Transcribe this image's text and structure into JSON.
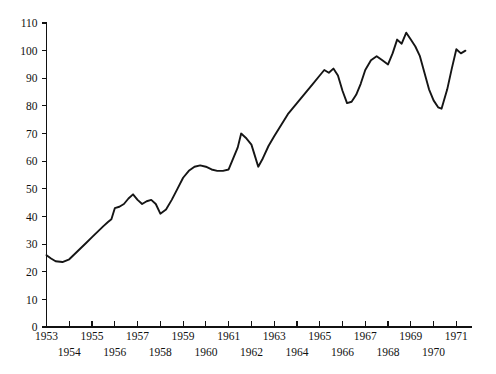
{
  "chart_data": {
    "type": "line",
    "title": "",
    "subtitle": "",
    "xlabel": "",
    "ylabel": "",
    "xlim": [
      1953.0,
      1971.6
    ],
    "ylim": [
      0,
      110
    ],
    "grid": false,
    "legend": null,
    "y_ticks": [
      0,
      10,
      20,
      30,
      40,
      50,
      60,
      70,
      80,
      90,
      100,
      110
    ],
    "y_tick_labels": [
      "0",
      "10",
      "20",
      "30",
      "40",
      "50",
      "60",
      "70",
      "80",
      "90",
      "100",
      "110"
    ],
    "x_ticks": [
      1953,
      1954,
      1955,
      1956,
      1957,
      1958,
      1959,
      1960,
      1961,
      1962,
      1963,
      1964,
      1965,
      1966,
      1967,
      1968,
      1969,
      1970,
      1971
    ],
    "x_tick_labels": [
      "1953",
      "1954",
      "1955",
      "1956",
      "1957",
      "1958",
      "1959",
      "1960",
      "1961",
      "1962",
      "1963",
      "1964",
      "1965",
      "1966",
      "1967",
      "1968",
      "1969",
      "1970",
      "1971"
    ],
    "x_tick_label_rows": [
      0,
      1,
      0,
      1,
      0,
      1,
      0,
      1,
      0,
      1,
      0,
      1,
      0,
      1,
      0,
      1,
      0,
      1,
      0
    ],
    "line_color": "#151515",
    "background_color": "#ffffff",
    "series": [
      {
        "name": "index",
        "x": [
          1953.0,
          1953.2,
          1953.4,
          1953.7,
          1954.0,
          1954.25,
          1954.5,
          1954.75,
          1955.0,
          1955.25,
          1955.5,
          1955.7,
          1955.85,
          1956.0,
          1956.2,
          1956.4,
          1956.6,
          1956.8,
          1957.0,
          1957.2,
          1957.4,
          1957.6,
          1957.8,
          1958.0,
          1958.25,
          1958.5,
          1958.75,
          1959.0,
          1959.25,
          1959.5,
          1959.75,
          1960.0,
          1960.25,
          1960.5,
          1960.75,
          1961.0,
          1961.2,
          1961.4,
          1961.55,
          1961.75,
          1962.0,
          1962.15,
          1962.3,
          1962.5,
          1962.75,
          1963.0,
          1963.3,
          1963.6,
          1964.0,
          1964.4,
          1964.7,
          1965.0,
          1965.2,
          1965.4,
          1965.6,
          1965.8,
          1966.0,
          1966.2,
          1966.4,
          1966.6,
          1966.8,
          1967.0,
          1967.25,
          1967.5,
          1967.75,
          1968.0,
          1968.2,
          1968.4,
          1968.6,
          1968.8,
          1969.0,
          1969.2,
          1969.4,
          1969.6,
          1969.8,
          1970.0,
          1970.2,
          1970.35,
          1970.6,
          1970.8,
          1971.0,
          1971.2,
          1971.4
        ],
        "values": [
          26.0,
          24.8,
          23.8,
          23.5,
          24.5,
          26.5,
          28.5,
          30.5,
          32.5,
          34.5,
          36.5,
          38.0,
          39.0,
          43.0,
          43.5,
          44.5,
          46.5,
          48.0,
          46.0,
          44.5,
          45.5,
          46.0,
          44.5,
          41.0,
          42.5,
          46.0,
          50.0,
          54.0,
          56.5,
          58.0,
          58.5,
          58.0,
          57.0,
          56.5,
          56.5,
          57.0,
          61.0,
          65.0,
          70.0,
          68.5,
          66.0,
          62.0,
          58.0,
          61.0,
          65.5,
          69.0,
          73.0,
          77.0,
          81.0,
          85.0,
          88.0,
          91.0,
          93.0,
          92.0,
          93.5,
          91.0,
          85.5,
          81.0,
          81.5,
          84.0,
          88.0,
          93.0,
          96.5,
          98.0,
          96.5,
          95.0,
          99.0,
          104.0,
          102.5,
          106.5,
          104.0,
          101.5,
          98.0,
          92.0,
          86.0,
          82.0,
          79.5,
          79.0,
          86.0,
          93.5,
          100.5,
          99.0,
          100.0
        ]
      }
    ]
  },
  "axis": {
    "y_axis_name": "vertical-value-axis",
    "x_axis_name": "horizontal-year-axis"
  }
}
